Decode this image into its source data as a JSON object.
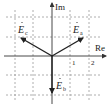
{
  "diagram": {
    "type": "phasor-diagram",
    "axes": {
      "x_label": "Re",
      "y_label": "Im",
      "x_ticks": [
        "1",
        "2"
      ]
    },
    "grid": {
      "style": "dashed",
      "spacing_units": 1,
      "x_range": [
        -2,
        2
      ],
      "y_range": [
        -2,
        2
      ]
    },
    "phasors": [
      {
        "name": "E_a",
        "label_main": "E",
        "label_sub": "a",
        "magnitude": 2,
        "angle_deg": 30
      },
      {
        "name": "E_b",
        "label_main": "E",
        "label_sub": "b",
        "magnitude": 2,
        "angle_deg": -90
      },
      {
        "name": "E_c",
        "label_main": "E",
        "label_sub": "c",
        "magnitude": 2,
        "angle_deg": 150
      }
    ],
    "colors": {
      "axis": "#333333",
      "grid": "#9a9a9a",
      "phasor": "#222222",
      "background": "#ffffff"
    }
  }
}
